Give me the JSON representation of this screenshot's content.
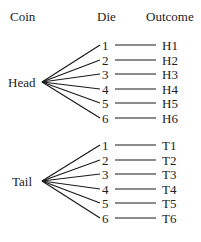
{
  "headers": {
    "coin": "Coin",
    "die": "Die",
    "outcome": "Outcome"
  },
  "branches": [
    {
      "label": "Head",
      "die": [
        "1",
        "2",
        "3",
        "4",
        "5",
        "6"
      ],
      "outcomes": [
        "H1",
        "H2",
        "H3",
        "H4",
        "H5",
        "H6"
      ]
    },
    {
      "label": "Tail",
      "die": [
        "1",
        "2",
        "3",
        "4",
        "5",
        "6"
      ],
      "outcomes": [
        "T1",
        "T2",
        "T3",
        "T4",
        "T5",
        "T6"
      ]
    }
  ],
  "colors": {
    "line": "#1a1a1a",
    "text": "#222222",
    "background": "#ffffff"
  }
}
